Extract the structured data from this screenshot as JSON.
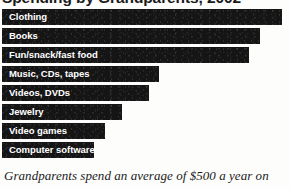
{
  "figure": {
    "title": "Spending by Grandparents, 2002",
    "caption": "Grandparents spend an average of $500 a year on",
    "bar_color": "#151515",
    "label_color": "#ffffff",
    "background_color": "#fdfdfc"
  },
  "chart_data": {
    "type": "bar",
    "orientation": "horizontal",
    "title": "Spending by Grandparents, 2002",
    "subtitle": "",
    "xlabel": "",
    "ylabel": "",
    "grid": false,
    "legend": "none",
    "axis_visible": false,
    "tick_labels_visible": false,
    "value_labels_visible": false,
    "xlim": [
      0,
      290
    ],
    "categories": [
      "Clothing",
      "Books",
      "Fun/snack/fast food",
      "Music, CDs, tapes",
      "Videos, DVDs",
      "Jewelry",
      "Video games",
      "Computer software"
    ],
    "values": [
      280,
      258,
      247,
      157,
      147,
      120,
      103,
      92
    ],
    "value_units": "relative bar length (px)",
    "annotations": [
      "Grandparents spend an average of $500 a year on"
    ]
  },
  "bars": [
    {
      "label": "Clothing",
      "length": 280
    },
    {
      "label": "Books",
      "length": 258
    },
    {
      "label": "Fun/snack/fast food",
      "length": 247
    },
    {
      "label": "Music, CDs, tapes",
      "length": 157
    },
    {
      "label": "Videos, DVDs",
      "length": 147
    },
    {
      "label": "Jewelry",
      "length": 120
    },
    {
      "label": "Video games",
      "length": 103
    },
    {
      "label": "Computer software",
      "length": 92
    }
  ]
}
